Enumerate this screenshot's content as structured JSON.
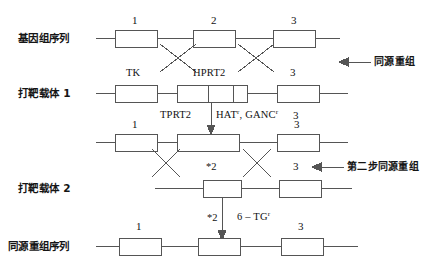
{
  "figure": {
    "title_present": false,
    "colors": {
      "line": "#555555",
      "box_stroke": "#555555",
      "box_fill": "#ffffff",
      "text": "#151515",
      "background": "#ffffff"
    }
  },
  "rows": [
    {
      "id": "genomic-sequence",
      "label": "基因组序列",
      "box_numbers": [
        "1",
        "2",
        "3"
      ]
    },
    {
      "id": "targeting-vector-1",
      "label": "打靶载体 1",
      "gene_labels": [
        "TK",
        "HPRT2",
        "3"
      ]
    },
    {
      "id": "first-recombinant",
      "label": "",
      "box_numbers": [
        "1",
        "3"
      ]
    },
    {
      "id": "targeting-vector-2",
      "label": "打靶载体 2",
      "box_numbers": [
        "*2",
        "3"
      ]
    },
    {
      "id": "recombined-sequence",
      "label": "同源重组序列",
      "box_numbers": [
        "1",
        "*2",
        "3"
      ]
    }
  ],
  "annotations": {
    "homologous_recombination": "同源重组",
    "second_step_recombination": "第二步同源重组",
    "selection_1_gene": "TPRT2",
    "selection_1_markers_a": "HAT",
    "selection_1_markers_a_sup": "r",
    "selection_1_sep": ", ",
    "selection_1_markers_b": "GANC",
    "selection_1_markers_b_sup": "r",
    "selection_1_trailing_number": "3",
    "selection_2": "6 – TG",
    "selection_2_sup": "r",
    "star_label_mid": "*2",
    "star_label_low": "*2"
  }
}
